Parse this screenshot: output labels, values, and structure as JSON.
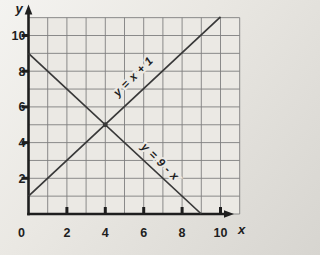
{
  "chart_data": {
    "type": "line",
    "title": "",
    "xlabel": "x",
    "ylabel": "y",
    "xlim": [
      0,
      11
    ],
    "ylim": [
      0,
      11
    ],
    "grid": true,
    "grid_step": 1,
    "x_ticks": [
      {
        "value": 0,
        "label": "0"
      },
      {
        "value": 2,
        "label": "2"
      },
      {
        "value": 4,
        "label": "4"
      },
      {
        "value": 6,
        "label": "6"
      },
      {
        "value": 8,
        "label": "8"
      },
      {
        "value": 10,
        "label": "10"
      }
    ],
    "y_ticks": [
      {
        "value": 2,
        "label": "2"
      },
      {
        "value": 4,
        "label": "4"
      },
      {
        "value": 6,
        "label": "6"
      },
      {
        "value": 8,
        "label": "8"
      },
      {
        "value": 10,
        "label": "10"
      }
    ],
    "series": [
      {
        "name": "line-y-equals-x-plus-1",
        "label": "y = x + 1",
        "points": [
          [
            0,
            1
          ],
          [
            10,
            11.05
          ]
        ],
        "label_anchor": [
          5.6,
          7.55
        ],
        "label_rotation": -45
      },
      {
        "name": "line-y-equals-9-minus-x",
        "label": "y = 9 - x",
        "points": [
          [
            0,
            9
          ],
          [
            9,
            0
          ]
        ],
        "label_anchor": [
          6.72,
          2.78
        ],
        "label_rotation": 45
      }
    ],
    "intersection_point": [
      4,
      5
    ]
  },
  "colors": {
    "plot_background": "#ebe9e4",
    "grid_line": "#7f7f7f",
    "axis": "#1e1e1e",
    "data_line": "#383838",
    "text": "#1e1e1e"
  }
}
